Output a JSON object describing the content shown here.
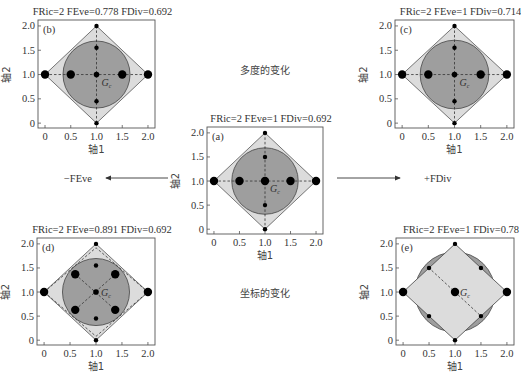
{
  "figure": {
    "center_labels": {
      "top": "多度的变化",
      "bottom": "坐标的变化"
    },
    "arrows": {
      "left": "−FEve",
      "right": "+FDiv"
    },
    "axis_labels": {
      "x": "轴1",
      "y": "轴2"
    },
    "ticks": [
      "0",
      "0.5",
      "1.0",
      "1.5",
      "2.0"
    ],
    "centroid_label": "G",
    "centroid_subscript": "c",
    "colors": {
      "circle_fill": "#9e9e9e",
      "diamond_fill": "#dcdcdc",
      "frame": "#555555",
      "points": "#000000"
    }
  },
  "panels": {
    "a": {
      "letter": "(a)",
      "title": "FRic=2  FEve=1 FDiv=0.692"
    },
    "b": {
      "letter": "(b)",
      "title": "FRic=2  FEve=0.778 FDiv=0.692"
    },
    "c": {
      "letter": "(c)",
      "title": "FRic=2  FEve=1 FDiv=0.714"
    },
    "d": {
      "letter": "(d)",
      "title": "FRic=2  FEve=0.891 FDiv=0.692"
    },
    "e": {
      "letter": "(e)",
      "title": "FRic=2  FEve=1 FDiv=0.78"
    }
  },
  "chart_data": [
    {
      "type": "scatter",
      "panel": "a",
      "title": "FRic=2  FEve=1 FDiv=0.692",
      "xlabel": "轴1",
      "ylabel": "轴2",
      "xlim": [
        0,
        2
      ],
      "ylim": [
        0,
        2
      ],
      "points": [
        [
          0,
          1
        ],
        [
          0.5,
          1
        ],
        [
          1,
          1
        ],
        [
          1.5,
          1
        ],
        [
          2,
          1
        ],
        [
          1,
          2
        ],
        [
          1,
          1.5
        ],
        [
          1,
          0.5
        ],
        [
          1,
          0
        ]
      ],
      "large_points": [
        [
          0,
          1
        ],
        [
          0.5,
          1
        ],
        [
          1,
          1
        ],
        [
          1.5,
          1
        ],
        [
          2,
          1
        ]
      ],
      "convex_hull": [
        [
          1,
          2
        ],
        [
          2,
          1
        ],
        [
          1,
          0
        ],
        [
          0,
          1
        ]
      ],
      "circle": {
        "center": [
          1,
          1
        ],
        "radius": 0.67
      }
    },
    {
      "type": "scatter",
      "panel": "b",
      "title": "FRic=2  FEve=0.778 FDiv=0.692",
      "xlabel": "轴1",
      "ylabel": "轴2",
      "xlim": [
        0,
        2
      ],
      "ylim": [
        0,
        2
      ],
      "points": [
        [
          0,
          1
        ],
        [
          0.5,
          1
        ],
        [
          1,
          1
        ],
        [
          1.5,
          1
        ],
        [
          2,
          1
        ],
        [
          1,
          2
        ],
        [
          1,
          1.55
        ],
        [
          1,
          0.45
        ],
        [
          1,
          0
        ]
      ],
      "large_points": [
        [
          0,
          1
        ],
        [
          0.5,
          1
        ],
        [
          1.5,
          1
        ],
        [
          2,
          1
        ]
      ],
      "convex_hull": [
        [
          1,
          2
        ],
        [
          2,
          1
        ],
        [
          1,
          0
        ],
        [
          0,
          1
        ]
      ],
      "circle": {
        "center": [
          1,
          1
        ],
        "radius": 0.67
      }
    },
    {
      "type": "scatter",
      "panel": "c",
      "title": "FRic=2  FEve=1 FDiv=0.714",
      "xlabel": "轴1",
      "ylabel": "轴2",
      "xlim": [
        0,
        2
      ],
      "ylim": [
        0,
        2
      ],
      "points": [
        [
          0,
          1
        ],
        [
          0.5,
          1
        ],
        [
          1,
          1
        ],
        [
          1.5,
          1
        ],
        [
          2,
          1
        ],
        [
          1,
          2
        ],
        [
          1,
          1.55
        ],
        [
          1,
          0.45
        ],
        [
          1,
          0
        ]
      ],
      "large_points": [
        [
          0,
          1
        ],
        [
          0.5,
          1
        ],
        [
          1.5,
          1
        ],
        [
          2,
          1
        ]
      ],
      "convex_hull": [
        [
          1,
          2
        ],
        [
          2,
          1
        ],
        [
          1,
          0
        ],
        [
          0,
          1
        ]
      ],
      "circle": {
        "center": [
          1,
          1
        ],
        "radius": 0.68
      }
    },
    {
      "type": "scatter",
      "panel": "d",
      "title": "FRic=2  FEve=0.891 FDiv=0.692",
      "xlabel": "轴1",
      "ylabel": "轴2",
      "xlim": [
        0,
        2
      ],
      "ylim": [
        0,
        2
      ],
      "points": [
        [
          0,
          1
        ],
        [
          2,
          1
        ],
        [
          1,
          2
        ],
        [
          1,
          0
        ],
        [
          1,
          1
        ],
        [
          1,
          1.55
        ],
        [
          1,
          0.45
        ],
        [
          0.6,
          1.37
        ],
        [
          1.37,
          1.37
        ],
        [
          0.6,
          0.63
        ],
        [
          1.37,
          0.63
        ]
      ],
      "large_points": [
        [
          0,
          1
        ],
        [
          2,
          1
        ],
        [
          0.6,
          1.37
        ],
        [
          1.37,
          1.37
        ],
        [
          0.6,
          0.63
        ],
        [
          1.37,
          0.63
        ]
      ],
      "convex_hull": [
        [
          1,
          2
        ],
        [
          2,
          1
        ],
        [
          1,
          0
        ],
        [
          0,
          1
        ]
      ],
      "circle": {
        "center": [
          1,
          1
        ],
        "radius": 0.67
      }
    },
    {
      "type": "scatter",
      "panel": "e",
      "title": "FRic=2  FEve=1 FDiv=0.78",
      "xlabel": "轴1",
      "ylabel": "轴2",
      "xlim": [
        0,
        2
      ],
      "ylim": [
        0,
        2
      ],
      "points": [
        [
          0,
          1
        ],
        [
          1,
          1
        ],
        [
          2,
          1
        ],
        [
          1,
          2
        ],
        [
          1,
          0
        ],
        [
          0.5,
          1.5
        ],
        [
          1.5,
          1.5
        ],
        [
          0.5,
          0.5
        ],
        [
          1.5,
          0.5
        ]
      ],
      "large_points": [
        [
          0,
          1
        ],
        [
          1,
          1
        ],
        [
          2,
          1
        ]
      ],
      "convex_hull": [
        [
          1,
          2
        ],
        [
          2,
          1
        ],
        [
          1,
          0
        ],
        [
          0,
          1
        ]
      ],
      "circle": {
        "center": [
          1,
          1
        ],
        "radius": 0.8
      }
    }
  ]
}
